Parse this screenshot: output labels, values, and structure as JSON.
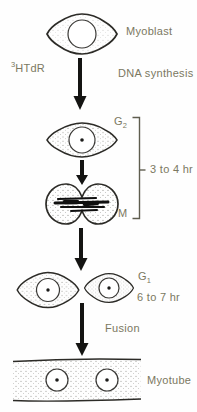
{
  "diagram": {
    "labels": {
      "reagent_sup": "3",
      "reagent_base": "HTdR",
      "myoblast": "Myoblast",
      "dna_synthesis": "DNA synthesis",
      "g2_base": "G",
      "g2_sub": "2",
      "duration_g2_m": "3 to 4 hr",
      "m_phase": "M",
      "g1_base": "G",
      "g1_sub": "1",
      "duration_g1": "6 to 7 hr",
      "fusion": "Fusion",
      "myotube": "Myotube"
    },
    "colors": {
      "label_text": "#7b7861",
      "outline": "#2c2b27",
      "nucleus_outline": "#3a3936",
      "arrow": "#141412",
      "bracket": "#5f5d4f",
      "stipple": "#5f5e57",
      "background": "#fefefe"
    }
  }
}
